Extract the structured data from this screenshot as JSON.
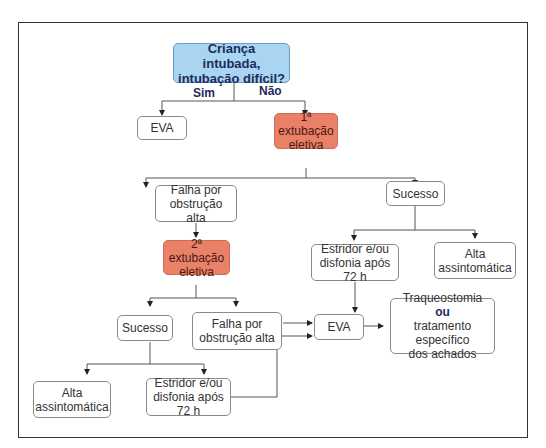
{
  "diagram": {
    "nodes": {
      "root": {
        "line1": "Criança intubada,",
        "line2": "intubação difícil?"
      },
      "eva_top": {
        "label": "EVA"
      },
      "ext1": {
        "line1": "1ª extubação",
        "line2": "eletiva"
      },
      "falha1": {
        "line1": "Falha por",
        "line2": "obstrução alta"
      },
      "sucesso1": {
        "label": "Sucesso"
      },
      "ext2": {
        "line1": "2ª extubação",
        "line2": "eletiva"
      },
      "estridor1": {
        "line1": "Estridor e/ou",
        "line2": "disfonia após 72 h"
      },
      "alta1": {
        "line1": "Alta",
        "line2": "assintomática"
      },
      "sucesso2": {
        "label": "Sucesso"
      },
      "falha2": {
        "line1": "Falha por",
        "line2": "obstrução alta"
      },
      "eva_bottom": {
        "label": "EVA"
      },
      "final": {
        "line1": "Traqueostomia",
        "line2": "ou",
        "line3": "tratamento específico",
        "line4": "dos achados"
      },
      "alta2": {
        "line1": "Alta",
        "line2": "assintomática"
      },
      "estridor2": {
        "line1": "Estridor e/ou",
        "line2": "disfonia após 72 h"
      }
    },
    "edge_labels": {
      "yes": "Sim",
      "no": "Não"
    },
    "colors": {
      "decision": "#a9d4f2",
      "action": "#e98068",
      "border": "#333333"
    }
  }
}
